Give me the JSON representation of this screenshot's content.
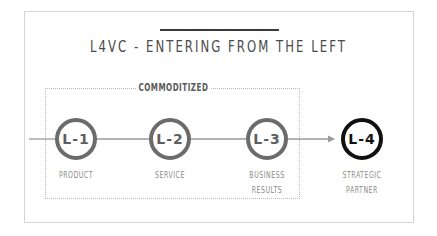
{
  "title": "L4VC - ENTERING FROM THE LEFT",
  "group": {
    "label": "COMMODITIZED"
  },
  "nodes": [
    {
      "label": "L-1",
      "caption_lines": [
        "PRODUCT"
      ]
    },
    {
      "label": "L-2",
      "caption_lines": [
        "SERVICE"
      ]
    },
    {
      "label": "L-3",
      "caption_lines": [
        "BUSINESS",
        "RESULTS"
      ]
    },
    {
      "label": "L-4",
      "caption_lines": [
        "STRATEGIC",
        "PARTNER"
      ]
    }
  ],
  "colors": {
    "node_border": "#6b6b6b",
    "active_border": "#111111",
    "line": "#9a9a9a",
    "frame": "#d4d4d4"
  }
}
